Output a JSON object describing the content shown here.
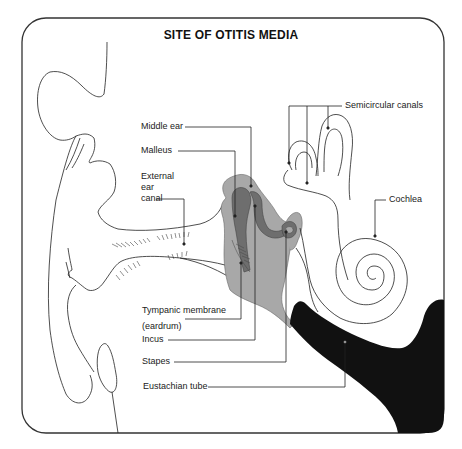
{
  "title": "SITE OF OTITIS MEDIA",
  "labels": {
    "middle_ear": "Middle ear",
    "malleus": "Malleus",
    "external_ear_canal": "External\near\ncanal",
    "tympanic_membrane": "Tympanic membrane\n(eardrum)",
    "incus": "Incus",
    "stapes": "Stapes",
    "eustachian_tube": "Eustachian tube",
    "semicircular_canals": "Semicircular canals",
    "cochlea": "Cochlea"
  },
  "colors": {
    "frame": "#333333",
    "middle_ear_fill": "#a8a8a8",
    "ossicle_fill": "#6e6e6e",
    "eustachian_fill": "#111111",
    "line": "#222222"
  }
}
